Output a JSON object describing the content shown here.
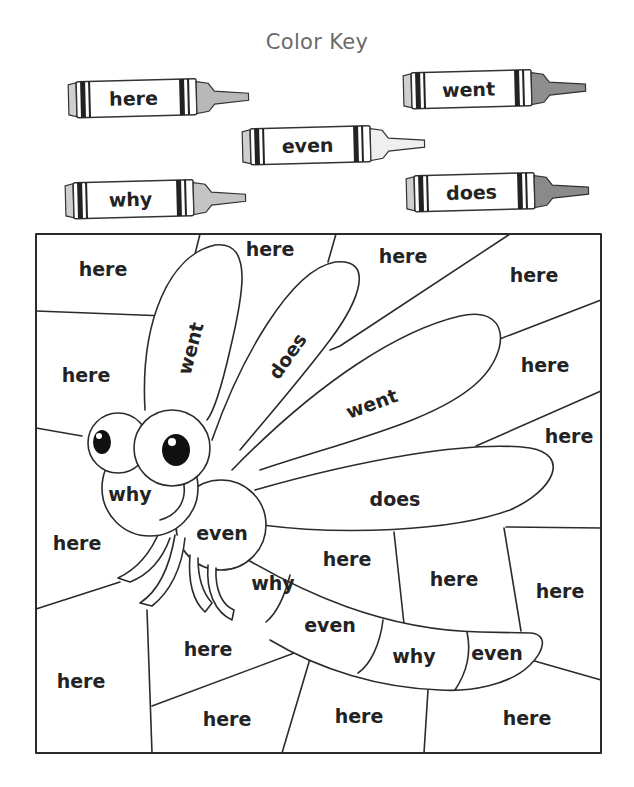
{
  "title": "Color Key",
  "color_key": [
    {
      "word": "here",
      "crayon_color": "#b8b8b8"
    },
    {
      "word": "went",
      "crayon_color": "#8e8e8e"
    },
    {
      "word": "even",
      "crayon_color": "#efefef"
    },
    {
      "word": "why",
      "crayon_color": "#c4c4c4"
    },
    {
      "word": "does",
      "crayon_color": "#8a8a8a"
    }
  ],
  "picture": {
    "subject": "dragonfly",
    "regions": {
      "bg_top_left": "here",
      "bg_top_middle": "here",
      "bg_top_center": "here",
      "bg_top_right": "here",
      "bg_left_upper": "here",
      "bg_right_upper": "here",
      "bg_right_middle": "here",
      "bg_left_lower": "here",
      "bg_center_below_wing": "here",
      "bg_center_right": "here",
      "bg_right_lower": "here",
      "bg_bottom_center_upper": "here",
      "bg_bottom_left": "here",
      "bg_bottom_center": "here",
      "bg_bottom_middle": "here",
      "bg_bottom_right": "here",
      "wing_upper_left": "went",
      "wing_upper_second": "does",
      "wing_upper_right": "went",
      "wing_lower": "does",
      "head": "why",
      "thorax": "even",
      "tail_seg_1": "why",
      "tail_seg_2": "even",
      "tail_seg_3": "why",
      "tail_seg_4": "even"
    }
  }
}
